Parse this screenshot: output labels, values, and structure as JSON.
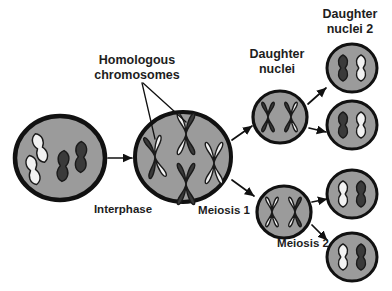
{
  "diagram": {
    "title_text_present": false,
    "background_color": "#ffffff",
    "colors": {
      "cell_fill": "#9b9b9b",
      "cell_outline": "#111111",
      "chromosome_dark": "#3a3a3a",
      "chromosome_light": "#f2f2f2",
      "chromosome_outline": "#1a1a1a",
      "text": "#1d1d1d",
      "arrow": "#111111"
    },
    "labels": [
      {
        "id": "homologous-chromosomes",
        "lines": [
          "Homologous",
          "chromosomes"
        ],
        "x": 137,
        "y": 68
      },
      {
        "id": "interphase",
        "lines": [
          "Interphase"
        ],
        "x": 123,
        "y": 210
      },
      {
        "id": "meiosis-1",
        "lines": [
          "Meiosis 1"
        ],
        "x": 224,
        "y": 211
      },
      {
        "id": "meiosis-2",
        "lines": [
          "Meiosis 2"
        ],
        "x": 303,
        "y": 244
      },
      {
        "id": "daughter-nuclei",
        "lines": [
          "Daughter",
          "nuclei"
        ],
        "x": 277,
        "y": 62
      },
      {
        "id": "daughter-nuclei-2",
        "lines": [
          "Daughter",
          "nuclei 2"
        ],
        "x": 350,
        "y": 22
      }
    ],
    "cells": [
      {
        "id": "interphase-cell",
        "stage": "Interphase",
        "cx": 60,
        "cy": 158,
        "rx": 45,
        "ry": 42,
        "outline_width": 4.5,
        "chromosome_form": "single-chromatid",
        "chromosome_count": 4,
        "chromosomes": [
          {
            "x": 40,
            "y": 148,
            "angle": -18,
            "shade": "light",
            "len": 30
          },
          {
            "x": 33,
            "y": 170,
            "angle": -14,
            "shade": "light",
            "len": 30
          },
          {
            "x": 63,
            "y": 166,
            "angle": 4,
            "shade": "dark",
            "len": 31
          },
          {
            "x": 81,
            "y": 157,
            "angle": 2,
            "shade": "dark",
            "len": 31
          }
        ]
      },
      {
        "id": "meiosis1-cell",
        "stage": "Meiosis 1",
        "cx": 183,
        "cy": 157,
        "rx": 48,
        "ry": 45,
        "outline_width": 4.0,
        "chromosome_form": "paired-x",
        "chromosome_count": 4,
        "chromosomes": [
          {
            "x": 155,
            "y": 157,
            "angle": -8,
            "left_shade": "dark",
            "right_shade": "light",
            "size": 21
          },
          {
            "x": 186,
            "y": 134,
            "angle": 0,
            "left_shade": "light",
            "right_shade": "dark",
            "size": 21
          },
          {
            "x": 186,
            "y": 184,
            "angle": 0,
            "left_shade": "dark",
            "right_shade": "dark",
            "size": 21
          },
          {
            "x": 214,
            "y": 163,
            "angle": 0,
            "left_shade": "light",
            "right_shade": "light",
            "size": 21
          }
        ]
      },
      {
        "id": "daughter-nucleus-top",
        "stage": "Daughter nuclei",
        "cx": 280,
        "cy": 117,
        "rx": 27,
        "ry": 26,
        "outline_width": 3.2,
        "chromosome_form": "paired-x",
        "chromosome_count": 2,
        "chromosomes": [
          {
            "x": 268,
            "y": 117,
            "angle": 0,
            "left_shade": "dark",
            "right_shade": "dark",
            "size": 15
          },
          {
            "x": 291,
            "y": 117,
            "angle": 0,
            "left_shade": "dark",
            "right_shade": "light",
            "size": 15
          }
        ]
      },
      {
        "id": "daughter-nucleus-bottom",
        "stage": "Daughter nuclei",
        "cx": 284,
        "cy": 212,
        "rx": 27,
        "ry": 26,
        "outline_width": 3.2,
        "chromosome_form": "paired-x",
        "chromosome_count": 2,
        "chromosomes": [
          {
            "x": 272,
            "y": 212,
            "angle": 0,
            "left_shade": "light",
            "right_shade": "light",
            "size": 15
          },
          {
            "x": 295,
            "y": 212,
            "angle": 0,
            "left_shade": "light",
            "right_shade": "dark",
            "size": 15
          }
        ]
      },
      {
        "id": "daughter-nucleus-2-a",
        "stage": "Daughter nuclei 2",
        "cx": 352,
        "cy": 68,
        "rx": 25,
        "ry": 24,
        "outline_width": 3.0,
        "chromosome_form": "single-chromatid",
        "chromosome_count": 2,
        "chromosomes": [
          {
            "x": 343,
            "y": 68,
            "angle": 0,
            "shade": "dark",
            "len": 26
          },
          {
            "x": 361,
            "y": 68,
            "angle": 0,
            "shade": "light",
            "len": 26
          }
        ]
      },
      {
        "id": "daughter-nucleus-2-b",
        "stage": "Daughter nuclei 2",
        "cx": 352,
        "cy": 125,
        "rx": 25,
        "ry": 24,
        "outline_width": 3.0,
        "chromosome_form": "single-chromatid",
        "chromosome_count": 2,
        "chromosomes": [
          {
            "x": 343,
            "y": 125,
            "angle": 0,
            "shade": "dark",
            "len": 26
          },
          {
            "x": 361,
            "y": 125,
            "angle": 0,
            "shade": "light",
            "len": 26
          }
        ]
      },
      {
        "id": "daughter-nucleus-2-c",
        "stage": "Daughter nuclei 2",
        "cx": 352,
        "cy": 194,
        "rx": 25,
        "ry": 24,
        "outline_width": 3.0,
        "chromosome_form": "single-chromatid",
        "chromosome_count": 2,
        "chromosomes": [
          {
            "x": 343,
            "y": 194,
            "angle": 0,
            "shade": "light",
            "len": 26
          },
          {
            "x": 361,
            "y": 194,
            "angle": 0,
            "shade": "dark",
            "len": 26
          }
        ]
      },
      {
        "id": "daughter-nucleus-2-d",
        "stage": "Daughter nuclei 2",
        "cx": 352,
        "cy": 257,
        "rx": 25,
        "ry": 24,
        "outline_width": 3.0,
        "chromosome_form": "single-chromatid",
        "chromosome_count": 2,
        "chromosomes": [
          {
            "x": 343,
            "y": 257,
            "angle": 0,
            "shade": "light",
            "len": 26
          },
          {
            "x": 361,
            "y": 257,
            "angle": 0,
            "shade": "dark",
            "len": 26
          }
        ]
      }
    ],
    "arrows": [
      {
        "id": "arrow-interphase-to-meiosis1",
        "x1": 108,
        "y1": 158,
        "x2": 132,
        "y2": 158
      },
      {
        "id": "arrow-meiosis1-to-daughter-top",
        "x1": 232,
        "y1": 140,
        "x2": 252,
        "y2": 126
      },
      {
        "id": "arrow-meiosis1-to-daughter-bottom",
        "x1": 232,
        "y1": 180,
        "x2": 254,
        "y2": 196
      },
      {
        "id": "arrow-daughter-top-to-nucleus-a",
        "x1": 308,
        "y1": 104,
        "x2": 326,
        "y2": 88
      },
      {
        "id": "arrow-daughter-top-to-nucleus-b",
        "x1": 309,
        "y1": 128,
        "x2": 326,
        "y2": 132
      },
      {
        "id": "arrow-daughter-bottom-to-nucleus-c",
        "x1": 312,
        "y1": 202,
        "x2": 327,
        "y2": 199
      },
      {
        "id": "arrow-daughter-bottom-to-nucleus-d",
        "x1": 312,
        "y1": 225,
        "x2": 327,
        "y2": 240
      }
    ],
    "pointer_lines": [
      {
        "id": "pointer-homologous-left",
        "x1": 142,
        "y1": 83,
        "x2": 155,
        "y2": 139
      },
      {
        "id": "pointer-homologous-right",
        "x1": 143,
        "y1": 83,
        "x2": 186,
        "y2": 122
      }
    ]
  }
}
